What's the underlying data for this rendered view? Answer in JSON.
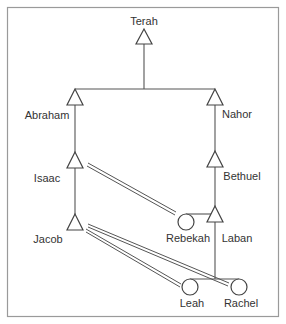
{
  "colors": {
    "line": "#555555",
    "frame": "#9a9a9a",
    "text": "#333333",
    "background": "#ffffff"
  },
  "people": [
    {
      "id": "terah",
      "name": "Terah",
      "sex": "male",
      "symbol": "triangle-icon"
    },
    {
      "id": "abraham",
      "name": "Abraham",
      "sex": "male",
      "symbol": "triangle-icon"
    },
    {
      "id": "nahor",
      "name": "Nahor",
      "sex": "male",
      "symbol": "triangle-icon"
    },
    {
      "id": "isaac",
      "name": "Isaac",
      "sex": "male",
      "symbol": "triangle-icon"
    },
    {
      "id": "bethuel",
      "name": "Bethuel",
      "sex": "male",
      "symbol": "triangle-icon"
    },
    {
      "id": "jacob",
      "name": "Jacob",
      "sex": "male",
      "symbol": "triangle-icon"
    },
    {
      "id": "rebekah",
      "name": "Rebekah",
      "sex": "female",
      "symbol": "circle-icon"
    },
    {
      "id": "laban",
      "name": "Laban",
      "sex": "male",
      "symbol": "triangle-icon"
    },
    {
      "id": "leah",
      "name": "Leah",
      "sex": "female",
      "symbol": "circle-icon"
    },
    {
      "id": "rachel",
      "name": "Rachel",
      "sex": "female",
      "symbol": "circle-icon"
    }
  ],
  "descent": [
    {
      "parent": "Terah",
      "children": [
        "Abraham",
        "Nahor"
      ]
    },
    {
      "parent": "Abraham",
      "children": [
        "Isaac"
      ]
    },
    {
      "parent": "Nahor",
      "children": [
        "Bethuel"
      ]
    },
    {
      "parent": "Isaac",
      "children": [
        "Jacob"
      ]
    },
    {
      "parent": "Bethuel",
      "children": [
        "Rebekah",
        "Laban"
      ]
    },
    {
      "parent": "Laban",
      "children": [
        "Leah",
        "Rachel"
      ]
    }
  ],
  "marriages": [
    {
      "husband": "Isaac",
      "wife": "Rebekah"
    },
    {
      "husband": "Jacob",
      "wife": "Leah"
    },
    {
      "husband": "Jacob",
      "wife": "Rachel"
    }
  ],
  "labels": {
    "terah": "Terah",
    "abraham": "Abraham",
    "nahor": "Nahor",
    "isaac": "Isaac",
    "bethuel": "Bethuel",
    "jacob": "Jacob",
    "rebekah": "Rebekah",
    "laban": "Laban",
    "leah": "Leah",
    "rachel": "Rachel"
  }
}
